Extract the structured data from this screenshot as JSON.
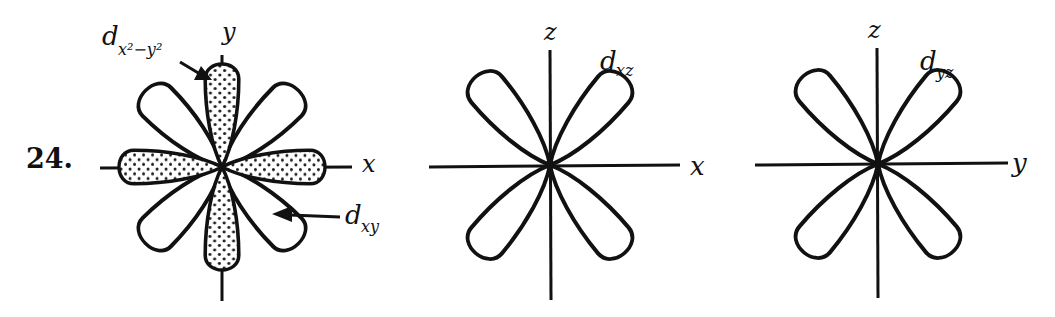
{
  "problem": {
    "number": "24."
  },
  "diagrams": [
    {
      "id": "dx2y2-dxy",
      "axes": {
        "vertical": "y",
        "horizontal": "x"
      },
      "labels": [
        {
          "text": "d",
          "sub": "x²−y²",
          "meaning": "d x squared minus y squared orbital (shaded lobes along axes)"
        },
        {
          "text": "d",
          "sub": "xy",
          "meaning": "d xy orbital (unshaded lobes between axes)"
        }
      ]
    },
    {
      "id": "dxz",
      "axes": {
        "vertical": "z",
        "horizontal": "x"
      },
      "labels": [
        {
          "text": "d",
          "sub": "xz",
          "meaning": "d xz orbital"
        }
      ]
    },
    {
      "id": "dyz",
      "axes": {
        "vertical": "z",
        "horizontal": "y"
      },
      "labels": [
        {
          "text": "d",
          "sub": "yz",
          "meaning": "d yz orbital"
        }
      ]
    }
  ],
  "colors": {
    "ink": "#111111",
    "background": "#ffffff"
  }
}
